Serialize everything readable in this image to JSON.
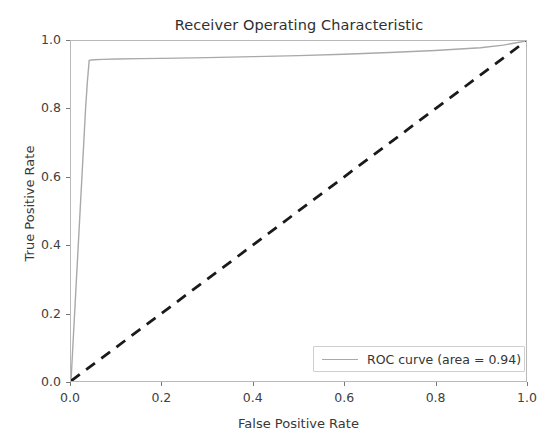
{
  "chart_data": {
    "type": "line",
    "title": "Receiver Operating Characteristic",
    "xlabel": "False Positive Rate",
    "ylabel": "True Positive Rate",
    "xlim": [
      0.0,
      1.0
    ],
    "ylim": [
      0.0,
      1.0
    ],
    "grid": false,
    "legend_position": "lower right",
    "xticks": [
      "0.0",
      "0.2",
      "0.4",
      "0.6",
      "0.8",
      "1.0"
    ],
    "xtick_values": [
      0.0,
      0.2,
      0.4,
      0.6,
      0.8,
      1.0
    ],
    "yticks": [
      "0.0",
      "0.2",
      "0.4",
      "0.6",
      "0.8",
      "1.0"
    ],
    "ytick_values": [
      0.0,
      0.2,
      0.4,
      0.6,
      0.8,
      1.0
    ],
    "auc": 0.94,
    "series": [
      {
        "name": "ROC curve (area = 0.94)",
        "color": "#a9a9a9",
        "linestyle": "solid",
        "linewidth": 1.4,
        "x": [
          0.0,
          0.004,
          0.008,
          0.012,
          0.016,
          0.02,
          0.024,
          0.028,
          0.032,
          0.036,
          0.04,
          0.05,
          0.07,
          0.1,
          0.15,
          0.2,
          0.3,
          0.4,
          0.5,
          0.6,
          0.7,
          0.8,
          0.9,
          0.95,
          1.0
        ],
        "y": [
          0.0,
          0.1,
          0.2,
          0.3,
          0.4,
          0.5,
          0.6,
          0.7,
          0.8,
          0.88,
          0.943,
          0.945,
          0.946,
          0.947,
          0.948,
          0.949,
          0.951,
          0.954,
          0.957,
          0.961,
          0.966,
          0.972,
          0.98,
          0.988,
          1.0
        ]
      },
      {
        "name": "chance-diagonal",
        "color": "#1a1a1a",
        "linestyle": "dashed",
        "linewidth": 2.6,
        "x": [
          0.0,
          1.0
        ],
        "y": [
          0.0,
          1.0
        ]
      }
    ]
  },
  "legend": {
    "entry_label": "ROC curve (area = 0.94)"
  }
}
